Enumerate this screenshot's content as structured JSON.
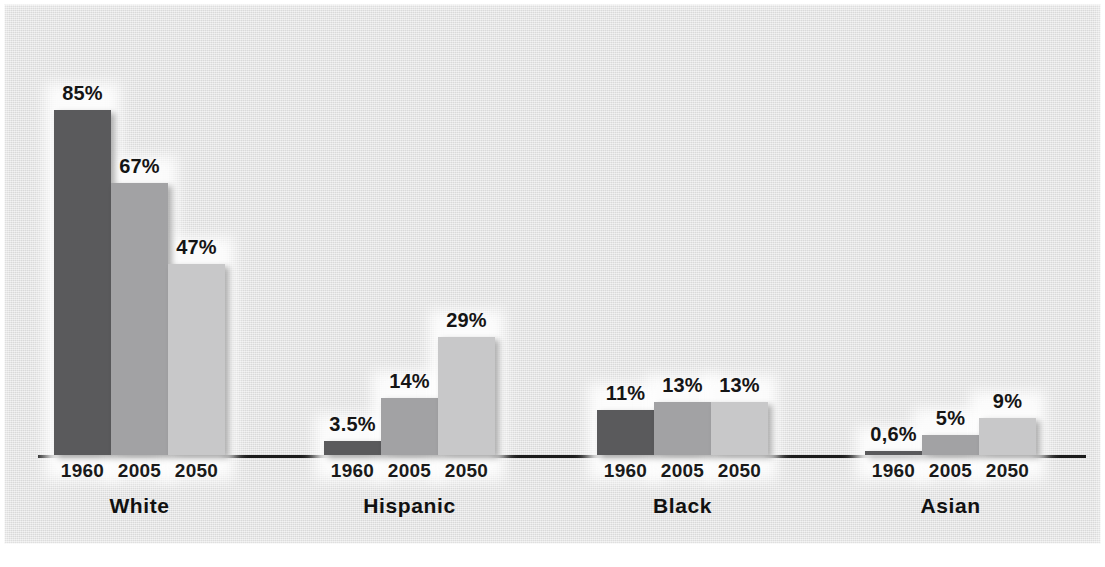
{
  "figure": {
    "background_color": "#e3e3e3",
    "axis_color": "#1c1c1c",
    "label_color": "#151515"
  },
  "palette": {
    "1960": "#5a5a5c",
    "2005": "#a2a2a4",
    "2050": "#c8c8c9"
  },
  "chart_data": {
    "type": "bar",
    "title": "",
    "subtitle": "",
    "xlabel": "",
    "ylabel": "",
    "ylim": [
      0,
      85
    ],
    "grid": false,
    "legend_position": "none",
    "categories": [
      "White",
      "Hispanic",
      "Black",
      "Asian"
    ],
    "x": [
      "1960",
      "2005",
      "2050"
    ],
    "series": [
      {
        "name": "1960",
        "color": "#5a5a5c",
        "values": [
          85,
          3.5,
          11,
          0.6
        ],
        "labels": [
          "85%",
          "3.5%",
          "11%",
          "0,6%"
        ]
      },
      {
        "name": "2005",
        "color": "#a2a2a4",
        "values": [
          67,
          14,
          13,
          5
        ],
        "labels": [
          "67%",
          "14%",
          "13%",
          "5%"
        ]
      },
      {
        "name": "2050",
        "color": "#c8c8c9",
        "values": [
          47,
          29,
          13,
          9
        ],
        "labels": [
          "47%",
          "29%",
          "13%",
          "9%"
        ]
      }
    ],
    "groups": [
      {
        "name": "White",
        "bars": [
          {
            "year": "1960",
            "value": 85,
            "label": "85%",
            "tone": "dark"
          },
          {
            "year": "2005",
            "value": 67,
            "label": "67%",
            "tone": "mid"
          },
          {
            "year": "2050",
            "value": 47,
            "label": "47%",
            "tone": "light"
          }
        ]
      },
      {
        "name": "Hispanic",
        "bars": [
          {
            "year": "1960",
            "value": 3.5,
            "label": "3.5%",
            "tone": "dark"
          },
          {
            "year": "2005",
            "value": 14,
            "label": "14%",
            "tone": "mid"
          },
          {
            "year": "2050",
            "value": 29,
            "label": "29%",
            "tone": "light"
          }
        ]
      },
      {
        "name": "Black",
        "bars": [
          {
            "year": "1960",
            "value": 11,
            "label": "11%",
            "tone": "dark"
          },
          {
            "year": "2005",
            "value": 13,
            "label": "13%",
            "tone": "mid"
          },
          {
            "year": "2050",
            "value": 13,
            "label": "13%",
            "tone": "light"
          }
        ]
      },
      {
        "name": "Asian",
        "bars": [
          {
            "year": "1960",
            "value": 0.6,
            "label": "0,6%",
            "tone": "dark"
          },
          {
            "year": "2005",
            "value": 5,
            "label": "5%",
            "tone": "mid"
          },
          {
            "year": "2050",
            "value": 9,
            "label": "9%",
            "tone": "light"
          }
        ]
      }
    ]
  },
  "layout": {
    "bar_width": 57,
    "px_per_unit": 4.06,
    "cluster_left": [
      54,
      324,
      597,
      865
    ]
  }
}
